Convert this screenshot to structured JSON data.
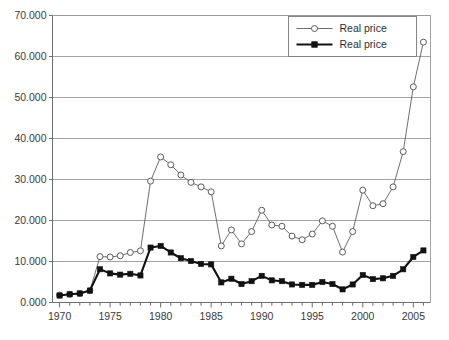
{
  "chart_data": {
    "type": "line",
    "title": "",
    "subtitle": "",
    "xlabel": "",
    "ylabel": "",
    "xlim": [
      1969.3,
      2006.7
    ],
    "ylim": [
      0,
      70
    ],
    "grid": true,
    "grid_axis": "y",
    "legend_position": "top-right",
    "y_tick_labels": [
      "0.000",
      "10.000",
      "20.000",
      "30.000",
      "40.000",
      "50.000",
      "60.000",
      "70.000"
    ],
    "y_tick_values": [
      0,
      10,
      20,
      30,
      40,
      50,
      60,
      70
    ],
    "x_tick_labels": [
      "1970",
      "1975",
      "1980",
      "1985",
      "1990",
      "1995",
      "2000",
      "2005"
    ],
    "x_tick_values": [
      1970,
      1975,
      1980,
      1985,
      1990,
      1995,
      2000,
      2005
    ],
    "x_minor_tick_step": 1,
    "x": [
      1970,
      1971,
      1972,
      1973,
      1974,
      1975,
      1976,
      1977,
      1978,
      1979,
      1980,
      1981,
      1982,
      1983,
      1984,
      1985,
      1986,
      1987,
      1988,
      1989,
      1990,
      1991,
      1992,
      1993,
      1994,
      1995,
      1996,
      1997,
      1998,
      1999,
      2000,
      2001,
      2002,
      2003,
      2004,
      2005,
      2006
    ],
    "series": [
      {
        "name": "Real price",
        "marker": "open-circle",
        "line_style": "thin",
        "color": "#4a4a4a",
        "values": [
          1.8,
          2.0,
          2.2,
          2.9,
          11.2,
          11.1,
          11.4,
          12.2,
          12.6,
          29.6,
          35.5,
          33.6,
          31.1,
          29.3,
          28.2,
          27.0,
          13.8,
          17.7,
          14.3,
          17.3,
          22.5,
          18.9,
          18.6,
          16.2,
          15.3,
          16.7,
          19.9,
          18.6,
          12.3,
          17.3,
          27.4,
          23.6,
          24.1,
          28.2,
          36.8,
          52.6,
          63.5
        ]
      },
      {
        "name": "Real price",
        "marker": "filled-square",
        "line_style": "thick",
        "color": "#111111",
        "values": [
          1.7,
          2.0,
          2.2,
          2.9,
          8.1,
          7.1,
          6.8,
          7.0,
          6.6,
          13.4,
          13.8,
          12.2,
          10.8,
          10.1,
          9.4,
          9.3,
          4.9,
          5.8,
          4.5,
          5.2,
          6.5,
          5.4,
          5.2,
          4.4,
          4.3,
          4.3,
          5.0,
          4.5,
          3.2,
          4.4,
          6.7,
          5.7,
          5.9,
          6.5,
          8.1,
          11.1,
          12.7
        ]
      }
    ]
  },
  "legend": {
    "entries": [
      {
        "label": "Real price",
        "marker": "open-circle"
      },
      {
        "label": "Real price",
        "marker": "filled-square"
      }
    ]
  },
  "caption": {
    "text": ""
  },
  "colors": {
    "grid": "#9a9a9a",
    "axis": "#6e6e6e",
    "series_open": "#4a4a4a",
    "series_filled": "#111111",
    "background": "#ffffff"
  }
}
